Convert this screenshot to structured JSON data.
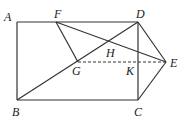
{
  "figure": {
    "points": {
      "A": {
        "label": "A",
        "x": 17,
        "y": 22,
        "lx": 4,
        "ly": 21
      },
      "B": {
        "label": "B",
        "x": 17,
        "y": 100,
        "lx": 12,
        "ly": 116
      },
      "C": {
        "label": "C",
        "x": 138,
        "y": 100,
        "lx": 134,
        "ly": 116
      },
      "D": {
        "label": "D",
        "x": 138,
        "y": 22,
        "lx": 136,
        "ly": 18
      },
      "E": {
        "label": "E",
        "x": 166,
        "y": 62,
        "lx": 170,
        "ly": 67
      },
      "F": {
        "label": "F",
        "x": 56,
        "y": 22,
        "lx": 54,
        "ly": 18
      },
      "G": {
        "label": "G",
        "x": 78,
        "y": 62,
        "lx": 72,
        "ly": 75
      },
      "H": {
        "label": "H",
        "x": 109,
        "y": 46,
        "lx": 106,
        "ly": 57
      },
      "K": {
        "label": "K",
        "x": 138,
        "y": 62,
        "lx": 126,
        "ly": 75
      }
    },
    "segments_solid": [
      "AD",
      "AB",
      "BC",
      "CD",
      "BD",
      "FE",
      "FG",
      "DE",
      "CE"
    ],
    "segments_dashed": [
      "GE"
    ]
  }
}
